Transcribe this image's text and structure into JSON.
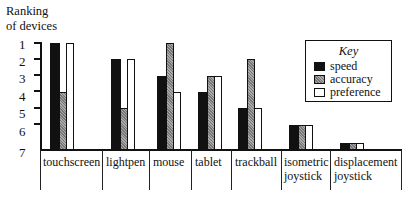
{
  "chart_data": {
    "type": "bar",
    "title": "",
    "ylabel": "Ranking of devices",
    "xlabel": "",
    "y_ticks": [
      "1",
      "2",
      "3",
      "4",
      "5",
      "6",
      "7"
    ],
    "ylim": [
      7,
      1
    ],
    "y_inverted": true,
    "grid": false,
    "legend_position": "upper right",
    "legend_title": "Key",
    "categories": [
      "touchscreen",
      "lightpen",
      "mouse",
      "tablet",
      "trackball",
      "isometric joystick",
      "displacement joystick"
    ],
    "series": [
      {
        "name": "speed",
        "values": [
          1,
          2,
          3,
          4,
          5,
          6,
          7
        ]
      },
      {
        "name": "accuracy",
        "values": [
          4,
          5,
          1,
          3,
          2,
          6,
          7
        ]
      },
      {
        "name": "preference",
        "values": [
          1,
          2,
          4,
          3,
          5,
          6,
          7
        ]
      }
    ]
  },
  "labels": {
    "ytitle_line1": "Ranking",
    "ytitle_line2": "of devices",
    "legend_title": "Key",
    "legend_speed": "speed",
    "legend_accuracy": "accuracy",
    "legend_preference": "preference",
    "cat0": "touchscreen",
    "cat1": "lightpen",
    "cat2": "mouse",
    "cat3": "tablet",
    "cat4_l1": "trackball",
    "cat5_l1": "isometric",
    "cat5_l2": "joystick",
    "cat6_l1": "displacement",
    "cat6_l2": "joystick",
    "y1": "1",
    "y2": "2",
    "y3": "3",
    "y4": "4",
    "y5": "5",
    "y6": "6",
    "y7": "7"
  }
}
